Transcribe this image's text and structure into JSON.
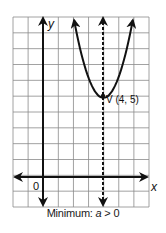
{
  "chart_data": {
    "type": "line",
    "title": "",
    "caption_prefix": "Minimum: ",
    "caption_var": "a",
    "caption_suffix": " > 0",
    "xlabel": "x",
    "ylabel": "y",
    "origin_label": "0",
    "xlim": [
      -2,
      7
    ],
    "ylim": [
      -2,
      10
    ],
    "grid": true,
    "series": [
      {
        "name": "parabola",
        "equation_form": "y = a(x - 4)^2 + 5, a > 0",
        "vertex": [
          4,
          5
        ],
        "a": 1.3,
        "opens": "up",
        "arrows_both_ends": true
      }
    ],
    "axis_of_symmetry": {
      "x": 4,
      "style": "dashed",
      "arrows_both_ends": true
    },
    "annotations": [
      {
        "label": "V (4, 5)",
        "x": 4,
        "y": 5
      }
    ]
  },
  "labels": {
    "x_axis": "x",
    "y_axis": "y",
    "origin": "0",
    "vertex": "V (4, 5)",
    "caption_prefix": "Minimum: ",
    "caption_var": "a",
    "caption_suffix": " > 0"
  },
  "colors": {
    "grid": "#8a8a8a",
    "ink": "#111111",
    "background": "#ffffff"
  }
}
